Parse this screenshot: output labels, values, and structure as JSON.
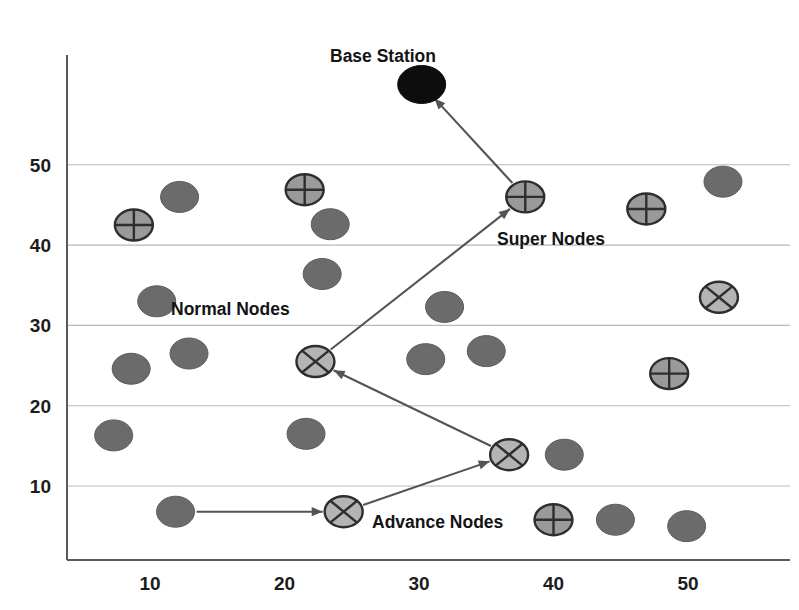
{
  "figure": {
    "title": "",
    "background_color": "#ffffff",
    "plot_area": {
      "left": 67,
      "top": 55,
      "right": 790,
      "bottom": 560
    }
  },
  "colors": {
    "normal_node": "#6b6b6b",
    "super_node": "#9a9a9a",
    "advance_node": "#b4b4b4",
    "base_station": "#0d0d0d",
    "gridline": "#b9b9b9",
    "axis": "#5a5a5a",
    "arrow": "#545454",
    "text": "#141414"
  },
  "annotations": [
    {
      "name": "base-station-label",
      "text": "Base Station",
      "x": 330,
      "y": 62
    },
    {
      "name": "super-nodes-label",
      "text": "Super Nodes",
      "x": 497,
      "y": 245
    },
    {
      "name": "normal-nodes-label",
      "text": "Normal Nodes",
      "x": 171,
      "y": 315
    },
    {
      "name": "advance-nodes-label",
      "text": "Advance Nodes",
      "x": 372,
      "y": 528
    }
  ],
  "chart_data": {
    "type": "scatter",
    "title": "",
    "xlabel": "",
    "ylabel": "",
    "xlim": [
      4,
      55
    ],
    "ylim": [
      2,
      62
    ],
    "grid": true,
    "legend_position": "inline-annotations",
    "xticks": [
      10,
      20,
      30,
      40,
      50
    ],
    "yticks": [
      10,
      20,
      30,
      40,
      50
    ],
    "xtick_labels": [
      "10",
      "20",
      "30",
      "40",
      "50"
    ],
    "ytick_labels": [
      "10",
      "20",
      "30",
      "40",
      "50"
    ],
    "series": [
      {
        "name": "Base Station",
        "marker": "filled-ellipse",
        "color": "#0d0d0d",
        "points": [
          {
            "x": 30.2,
            "y": 60.0
          }
        ]
      },
      {
        "name": "Super Nodes",
        "marker": "circle-plus",
        "color": "#9a9a9a",
        "points": [
          {
            "x": 8.8,
            "y": 42.5
          },
          {
            "x": 21.5,
            "y": 46.9
          },
          {
            "x": 37.9,
            "y": 46.0
          },
          {
            "x": 46.9,
            "y": 44.5
          },
          {
            "x": 48.6,
            "y": 24.0
          },
          {
            "x": 40.0,
            "y": 5.8
          }
        ]
      },
      {
        "name": "Advance Nodes",
        "marker": "circle-cross",
        "color": "#b4b4b4",
        "points": [
          {
            "x": 22.3,
            "y": 25.5
          },
          {
            "x": 36.7,
            "y": 13.9
          },
          {
            "x": 24.4,
            "y": 6.8
          },
          {
            "x": 52.3,
            "y": 33.5
          }
        ]
      },
      {
        "name": "Normal Nodes",
        "marker": "filled-ellipse",
        "color": "#6b6b6b",
        "points": [
          {
            "x": 12.2,
            "y": 46.0
          },
          {
            "x": 23.4,
            "y": 42.6
          },
          {
            "x": 22.8,
            "y": 36.4
          },
          {
            "x": 10.5,
            "y": 33.0
          },
          {
            "x": 31.9,
            "y": 32.3
          },
          {
            "x": 52.6,
            "y": 47.9
          },
          {
            "x": 8.6,
            "y": 24.6
          },
          {
            "x": 12.9,
            "y": 26.5
          },
          {
            "x": 30.5,
            "y": 25.8
          },
          {
            "x": 35.0,
            "y": 26.8
          },
          {
            "x": 7.3,
            "y": 16.3
          },
          {
            "x": 21.6,
            "y": 16.5
          },
          {
            "x": 40.8,
            "y": 13.9
          },
          {
            "x": 11.9,
            "y": 6.8
          },
          {
            "x": 44.6,
            "y": 5.8
          },
          {
            "x": 49.9,
            "y": 5.0
          }
        ]
      }
    ],
    "routes": [
      {
        "name": "route-normal-to-advance",
        "from": {
          "x": 11.9,
          "y": 6.8
        },
        "to": {
          "x": 24.4,
          "y": 6.8
        }
      },
      {
        "name": "route-advance-to-advance",
        "from": {
          "x": 24.4,
          "y": 6.8
        },
        "to": {
          "x": 36.7,
          "y": 13.9
        }
      },
      {
        "name": "route-advance-to-advance-2",
        "from": {
          "x": 36.7,
          "y": 13.9
        },
        "to": {
          "x": 22.3,
          "y": 25.5
        }
      },
      {
        "name": "route-advance-to-super",
        "from": {
          "x": 22.3,
          "y": 25.5
        },
        "to": {
          "x": 37.9,
          "y": 46.0
        }
      },
      {
        "name": "route-super-to-base",
        "from": {
          "x": 37.9,
          "y": 46.0
        },
        "to": {
          "x": 30.2,
          "y": 60.0
        }
      }
    ]
  }
}
